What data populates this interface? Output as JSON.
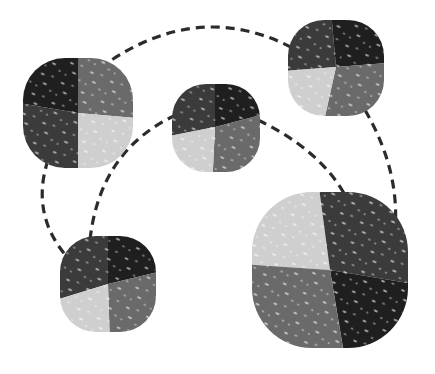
{
  "diagram": {
    "type": "network-graph",
    "colors": {
      "wedge_darkest": "#1f1f1f",
      "wedge_dark": "#3b3b3b",
      "wedge_medium": "#6a6a6a",
      "wedge_light": "#cfcfcf",
      "edge": "#2b2b2b",
      "background": "#ffffff"
    },
    "nodes": [
      {
        "id": "A",
        "cx": 78,
        "cy": 113,
        "r": 55,
        "rotation": 0
      },
      {
        "id": "B",
        "cx": 215,
        "cy": 127,
        "r": 44,
        "rotation": 10
      },
      {
        "id": "C",
        "cx": 336,
        "cy": 67,
        "r": 48,
        "rotation": 15
      },
      {
        "id": "D",
        "cx": 108,
        "cy": 284,
        "r": 48,
        "rotation": 15
      },
      {
        "id": "E",
        "cx": 330,
        "cy": 270,
        "r": 78,
        "rotation": -10
      }
    ],
    "edges": [
      {
        "from": "A",
        "to": "C",
        "style": "dashed"
      },
      {
        "from": "A",
        "to": "D",
        "style": "dashed"
      },
      {
        "from": "B",
        "to": "D",
        "style": "dashed"
      },
      {
        "from": "B",
        "to": "E",
        "style": "dashed"
      },
      {
        "from": "C",
        "to": "E",
        "style": "dashed"
      }
    ]
  }
}
